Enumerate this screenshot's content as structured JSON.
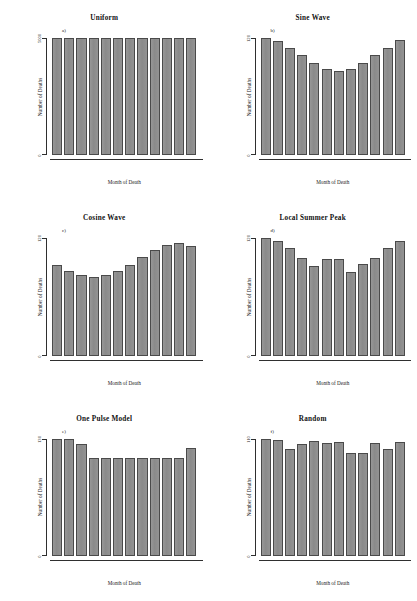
{
  "figure": {
    "axis_titles": {
      "y": "Number of Deaths",
      "x": "Month of Death"
    },
    "bar_color": "#8c8c8c",
    "bar_edge_color": "#4a4a4a",
    "background": "#ffffff"
  },
  "chart_data": [
    {
      "type": "bar",
      "panel": "a)",
      "title": "Uniform",
      "xlabel": "Month of Death",
      "ylabel": "Number of Deaths",
      "categories": [
        "1",
        "2",
        "3",
        "4",
        "5",
        "6",
        "7",
        "8",
        "9",
        "10",
        "11",
        "12"
      ],
      "values": [
        5000,
        5000,
        5000,
        5000,
        5000,
        5000,
        5000,
        5000,
        5000,
        5000,
        5000,
        5000
      ],
      "ylim": [
        0,
        5000
      ],
      "yticks": [
        0,
        5000
      ],
      "ytick_labels": [
        "0",
        "5000"
      ],
      "grid": false,
      "legend": "none"
    },
    {
      "type": "bar",
      "panel": "b)",
      "title": "Sine Wave",
      "xlabel": "Month of Death",
      "ylabel": "Number of Deaths",
      "categories": [
        "1",
        "2",
        "3",
        "4",
        "5",
        "6",
        "7",
        "8",
        "9",
        "10",
        "11",
        "12"
      ],
      "values": [
        120,
        117,
        110,
        103,
        94,
        88,
        86,
        88,
        94,
        103,
        110,
        118
      ],
      "ylim": [
        0,
        120
      ],
      "yticks": [
        0,
        120
      ],
      "ytick_labels": [
        "0",
        "120"
      ],
      "grid": false,
      "legend": "none"
    },
    {
      "type": "bar",
      "panel": "c)",
      "title": "Cosine Wave",
      "xlabel": "Month of Death",
      "ylabel": "Number of Deaths",
      "categories": [
        "1",
        "2",
        "3",
        "4",
        "5",
        "6",
        "7",
        "8",
        "9",
        "10",
        "11",
        "12"
      ],
      "values": [
        93,
        87,
        82,
        80,
        82,
        87,
        93,
        101,
        108,
        113,
        115,
        112
      ],
      "ylim": [
        0,
        120
      ],
      "yticks": [
        0,
        120
      ],
      "ytick_labels": [
        "0",
        "120"
      ],
      "grid": false,
      "legend": "none"
    },
    {
      "type": "bar",
      "panel": "d)",
      "title": "Local Summer Peak",
      "xlabel": "Month of Death",
      "ylabel": "Number of Deaths",
      "categories": [
        "1",
        "2",
        "3",
        "4",
        "5",
        "6",
        "7",
        "8",
        "9",
        "10",
        "11",
        "12"
      ],
      "values": [
        120,
        117,
        110,
        100,
        92,
        99,
        99,
        86,
        94,
        100,
        110,
        117
      ],
      "ylim": [
        0,
        120
      ],
      "yticks": [
        0,
        120
      ],
      "ytick_labels": [
        "0",
        "120"
      ],
      "grid": false,
      "legend": "none"
    },
    {
      "type": "bar",
      "panel": "e)",
      "title": "One Pulse Model",
      "xlabel": "Month of Death",
      "ylabel": "Number of Deaths",
      "categories": [
        "1",
        "2",
        "3",
        "4",
        "5",
        "6",
        "7",
        "8",
        "9",
        "10",
        "11",
        "12"
      ],
      "values": [
        130,
        130,
        124,
        109,
        109,
        109,
        109,
        109,
        109,
        109,
        109,
        120
      ],
      "ylim": [
        0,
        130
      ],
      "yticks": [
        0,
        130
      ],
      "ytick_labels": [
        "0",
        "130"
      ],
      "grid": false,
      "legend": "none"
    },
    {
      "type": "bar",
      "panel": "f)",
      "title": "Random",
      "xlabel": "Month of Death",
      "ylabel": "Number of Deaths",
      "categories": [
        "1",
        "2",
        "3",
        "4",
        "5",
        "6",
        "7",
        "8",
        "9",
        "10",
        "11",
        "12"
      ],
      "values": [
        110,
        109,
        100,
        105,
        108,
        106,
        107,
        97,
        97,
        106,
        100,
        107
      ],
      "ylim": [
        0,
        110
      ],
      "yticks": [
        0,
        110
      ],
      "ytick_labels": [
        "0",
        "110"
      ],
      "grid": false,
      "legend": "none"
    }
  ]
}
